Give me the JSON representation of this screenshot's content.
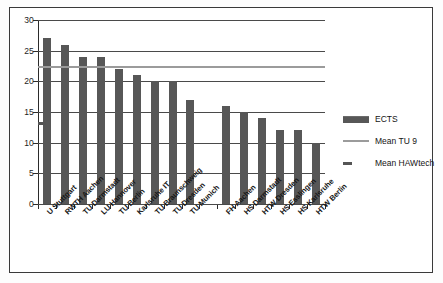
{
  "chart_data": {
    "type": "bar",
    "title": "",
    "xlabel": "",
    "ylabel": "",
    "ylim": [
      0,
      30
    ],
    "ytick_values": [
      0,
      5,
      10,
      15,
      20,
      25,
      30
    ],
    "ytick_labels": [
      "0",
      "5",
      "10",
      "15",
      "20",
      "25",
      "30"
    ],
    "grid": true,
    "legend_position": "right",
    "categories": [
      "U Stuttgart",
      "RWTH Aachen",
      "TU Darmstadt",
      "LU Hannover",
      "TU Berlin",
      "Karlsruhe IT",
      "TU Braunschweig",
      "TU Dresden",
      "TU Munich",
      "",
      "FH Aachen",
      "HS Darmstadt",
      "HTW Dresden",
      "HS Esslingen",
      "HS Karlsruhe",
      "HTW Berlin"
    ],
    "series": [
      {
        "name": "ECTS",
        "type": "bar",
        "color": "#575757",
        "values": [
          27,
          26,
          24,
          24,
          22,
          21,
          20,
          20,
          17,
          null,
          16,
          15,
          14,
          12,
          12,
          10
        ]
      },
      {
        "name": "Mean TU 9",
        "type": "hline",
        "style": "solid",
        "color": "#9b9b9b",
        "value": 22.3
      },
      {
        "name": "Mean HAWtech",
        "type": "hline",
        "style": "dashed",
        "color": "#555555",
        "value": 13.2
      }
    ],
    "legend": [
      {
        "label": "ECTS",
        "key": "bar"
      },
      {
        "label": "Mean TU 9",
        "key": "line"
      },
      {
        "label": "Mean HAWtech",
        "key": "dash"
      }
    ]
  }
}
